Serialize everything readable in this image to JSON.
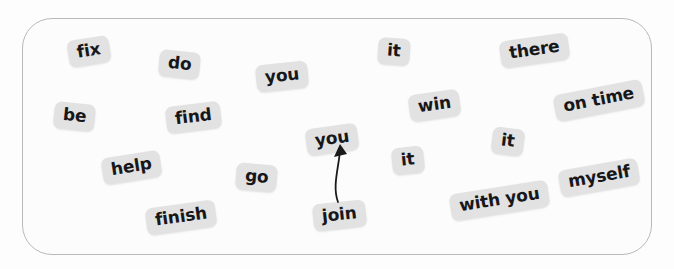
{
  "scene": {
    "width": 674,
    "height": 269,
    "background_color": "#fdfdfd",
    "frame": {
      "name": "rounded-worksheet-border",
      "border_color": "#b9b9bc",
      "fill_color": "#fcfcfc",
      "radius_px": 30
    },
    "tile_style": {
      "fill_color": "#e2e2e2",
      "text_color": "#17171a"
    }
  },
  "tiles": [
    {
      "label": "fix",
      "x": 68,
      "y": 38,
      "rotation": -9,
      "font_size": 17
    },
    {
      "label": "do",
      "x": 159,
      "y": 51,
      "rotation": 6,
      "font_size": 17
    },
    {
      "label": "you",
      "x": 256,
      "y": 63,
      "rotation": -6,
      "font_size": 17
    },
    {
      "label": "it",
      "x": 378,
      "y": 38,
      "rotation": 4,
      "font_size": 17
    },
    {
      "label": "there",
      "x": 500,
      "y": 37,
      "rotation": -8,
      "font_size": 17
    },
    {
      "label": "be",
      "x": 54,
      "y": 103,
      "rotation": 6,
      "font_size": 17
    },
    {
      "label": "find",
      "x": 166,
      "y": 104,
      "rotation": -7,
      "font_size": 17
    },
    {
      "label": "win",
      "x": 409,
      "y": 92,
      "rotation": -8,
      "font_size": 17
    },
    {
      "label": "on time",
      "x": 554,
      "y": 87,
      "rotation": -11,
      "font_size": 17
    },
    {
      "label": "you",
      "x": 306,
      "y": 126,
      "rotation": -8,
      "font_size": 17
    },
    {
      "label": "it",
      "x": 492,
      "y": 128,
      "rotation": 7,
      "font_size": 17
    },
    {
      "label": "help",
      "x": 102,
      "y": 154,
      "rotation": -9,
      "font_size": 17
    },
    {
      "label": "go",
      "x": 236,
      "y": 164,
      "rotation": 5,
      "font_size": 17
    },
    {
      "label": "it",
      "x": 392,
      "y": 147,
      "rotation": -6,
      "font_size": 17
    },
    {
      "label": "myself",
      "x": 559,
      "y": 164,
      "rotation": -10,
      "font_size": 17
    },
    {
      "label": "finish",
      "x": 146,
      "y": 204,
      "rotation": -8,
      "font_size": 17
    },
    {
      "label": "join",
      "x": 313,
      "y": 202,
      "rotation": -6,
      "font_size": 17
    },
    {
      "label": "with you",
      "x": 450,
      "y": 187,
      "rotation": -9,
      "font_size": 17
    }
  ],
  "annotations": [
    {
      "name": "curved-arrow-join-to-you",
      "type": "curved-arrow",
      "from_label": "join",
      "to_label": "you",
      "color": "#1a1a1a",
      "path": "M 338 202 C 332 186, 339 167, 340 150",
      "arrowhead": "M 340 144 L 334 157 L 347 154 Z"
    }
  ]
}
